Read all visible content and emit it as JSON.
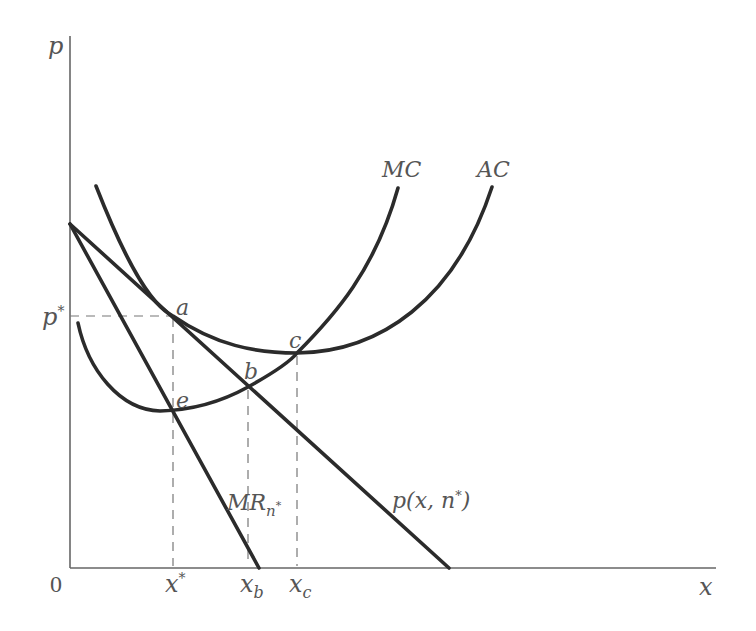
{
  "diagram": {
    "axes": {
      "y_label": "p",
      "x_label": "x",
      "origin_label": "0"
    },
    "price_level": {
      "label": "p",
      "sup": "*"
    },
    "x_ticks": [
      {
        "id": "xstar",
        "base": "x",
        "sup": "*"
      },
      {
        "id": "xb",
        "base": "x",
        "sub": "b"
      },
      {
        "id": "xc",
        "base": "x",
        "sub": "c"
      }
    ],
    "curves": {
      "mc": {
        "label": "MC"
      },
      "ac": {
        "label": "AC"
      },
      "mr": {
        "label_base": "MR",
        "label_sub": "n",
        "label_subsup": "*"
      },
      "demand": {
        "label": "p(x, n",
        "label_sup": "*",
        "label_close": ")"
      }
    },
    "points": {
      "a": "a",
      "b": "b",
      "c": "c",
      "e": "e"
    },
    "colors": {
      "curve": "#2b2b2b",
      "axis": "#666666",
      "text": "#555555"
    }
  }
}
